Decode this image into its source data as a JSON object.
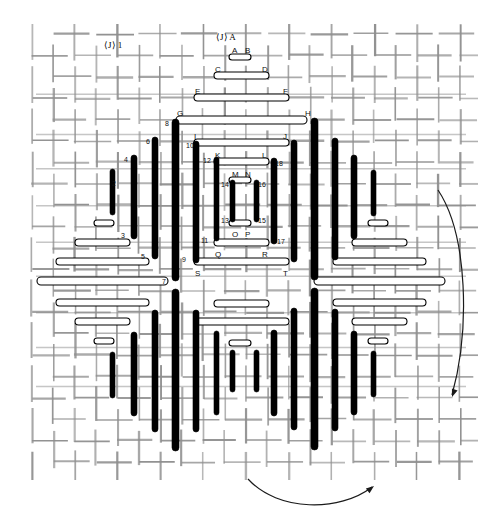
{
  "figure": {
    "type": "technical-line-drawing",
    "width": 502,
    "height": 529,
    "background_color": "#ffffff",
    "mesh_color": "#8f8f8f",
    "bar_fill_black": "#000000",
    "bar_fill_white": "#ffffff",
    "bar_stroke": "#000000"
  },
  "section_markers": [
    {
      "name": "section-j-left",
      "text": "⟨J⟩",
      "suffix": "1",
      "x": 104,
      "y": 41
    },
    {
      "name": "section-j-top",
      "text": "⟨J⟩",
      "suffix": "A",
      "x": 216,
      "y": 33
    }
  ],
  "letter_pairs": [
    {
      "name": "pair-ab",
      "left": "A",
      "right": "B",
      "lx": 232,
      "ly": 47,
      "rx": 245,
      "ry": 47,
      "bar": {
        "x": 229,
        "y": 54,
        "w": 22,
        "h": 6
      }
    },
    {
      "name": "pair-cd",
      "left": "C",
      "right": "D",
      "lx": 215,
      "ly": 66,
      "rx": 262,
      "ry": 66,
      "bar": {
        "x": 214,
        "y": 72,
        "w": 55,
        "h": 7
      }
    },
    {
      "name": "pair-ef",
      "left": "E",
      "right": "F",
      "lx": 195,
      "ly": 88,
      "rx": 283,
      "ry": 88,
      "bar": {
        "x": 194,
        "y": 94,
        "w": 95,
        "h": 7
      }
    },
    {
      "name": "pair-gh",
      "left": "G",
      "right": "H",
      "lx": 177,
      "ly": 110,
      "rx": 305,
      "ry": 110,
      "bar": {
        "x": 176,
        "y": 116,
        "w": 131,
        "h": 8
      }
    },
    {
      "name": "pair-ij",
      "left": "I",
      "right": "J",
      "lx": 194,
      "ly": 133,
      "rx": 283,
      "ry": 133,
      "bar": {
        "x": 194,
        "y": 139,
        "w": 95,
        "h": 7
      }
    },
    {
      "name": "pair-kl",
      "left": "K",
      "right": "L",
      "lx": 215,
      "ly": 152,
      "rx": 262,
      "ry": 152,
      "bar": {
        "x": 214,
        "y": 158,
        "w": 55,
        "h": 7
      }
    },
    {
      "name": "pair-mn",
      "left": "M",
      "right": "N",
      "lx": 232,
      "ly": 171,
      "rx": 245,
      "ry": 171,
      "bar": {
        "x": 229,
        "y": 177,
        "w": 22,
        "h": 6
      }
    },
    {
      "name": "pair-op",
      "left": "O",
      "right": "P",
      "lx": 232,
      "ly": 231,
      "rx": 245,
      "ry": 231,
      "bar": {
        "x": 229,
        "y": 220,
        "w": 22,
        "h": 6
      }
    },
    {
      "name": "pair-qr",
      "left": "Q",
      "right": "R",
      "lx": 215,
      "ly": 251,
      "rx": 262,
      "ry": 251,
      "bar": {
        "x": 214,
        "y": 239,
        "w": 55,
        "h": 7
      }
    },
    {
      "name": "pair-st",
      "left": "S",
      "right": "T",
      "lx": 195,
      "ly": 270,
      "rx": 283,
      "ry": 270,
      "bar": {
        "x": 194,
        "y": 258,
        "w": 95,
        "h": 7
      }
    }
  ],
  "even_labels": [
    {
      "text": "2",
      "x": 112,
      "y": 180
    },
    {
      "text": "4",
      "x": 124,
      "y": 156
    },
    {
      "text": "6",
      "x": 146,
      "y": 138
    },
    {
      "text": "8",
      "x": 165,
      "y": 120
    },
    {
      "text": "10",
      "x": 186,
      "y": 142
    },
    {
      "text": "12",
      "x": 203,
      "y": 157
    },
    {
      "text": "14",
      "x": 221,
      "y": 181
    },
    {
      "text": "16",
      "x": 258,
      "y": 181
    },
    {
      "text": "18",
      "x": 275,
      "y": 160
    }
  ],
  "odd_labels": [
    {
      "text": "3",
      "x": 121,
      "y": 232
    },
    {
      "text": "5",
      "x": 141,
      "y": 253
    },
    {
      "text": "7",
      "x": 162,
      "y": 278
    },
    {
      "text": "9",
      "x": 182,
      "y": 256
    },
    {
      "text": "11",
      "x": 201,
      "y": 237
    },
    {
      "text": "13",
      "x": 221,
      "y": 217
    },
    {
      "text": "15",
      "x": 258,
      "y": 217
    },
    {
      "text": "17",
      "x": 277,
      "y": 238
    }
  ],
  "black_bars_top": [
    {
      "x": 110,
      "y": 169,
      "h": 46,
      "w": 5
    },
    {
      "x": 131,
      "y": 155,
      "h": 84,
      "w": 6
    },
    {
      "x": 152,
      "y": 137,
      "h": 122,
      "w": 6
    },
    {
      "x": 172,
      "y": 119,
      "h": 162,
      "w": 7
    },
    {
      "x": 193,
      "y": 141,
      "h": 122,
      "w": 6
    },
    {
      "x": 214,
      "y": 157,
      "h": 84,
      "w": 5
    },
    {
      "x": 230,
      "y": 180,
      "h": 42,
      "w": 5
    },
    {
      "x": 254,
      "y": 180,
      "h": 42,
      "w": 5
    },
    {
      "x": 271,
      "y": 158,
      "h": 86,
      "w": 6
    },
    {
      "x": 291,
      "y": 140,
      "h": 122,
      "w": 6
    },
    {
      "x": 311,
      "y": 118,
      "h": 162,
      "w": 7
    },
    {
      "x": 332,
      "y": 138,
      "h": 122,
      "w": 6
    },
    {
      "x": 351,
      "y": 155,
      "h": 84,
      "w": 6
    },
    {
      "x": 371,
      "y": 170,
      "h": 46,
      "w": 5
    }
  ],
  "black_bars_bottom": [
    {
      "x": 110,
      "y": 352,
      "h": 46,
      "w": 5
    },
    {
      "x": 131,
      "y": 332,
      "h": 84,
      "w": 6
    },
    {
      "x": 152,
      "y": 310,
      "h": 122,
      "w": 6
    },
    {
      "x": 172,
      "y": 289,
      "h": 162,
      "w": 7
    },
    {
      "x": 193,
      "y": 310,
      "h": 122,
      "w": 6
    },
    {
      "x": 214,
      "y": 331,
      "h": 84,
      "w": 5
    },
    {
      "x": 230,
      "y": 350,
      "h": 42,
      "w": 5
    },
    {
      "x": 254,
      "y": 350,
      "h": 42,
      "w": 5
    },
    {
      "x": 271,
      "y": 330,
      "h": 86,
      "w": 6
    },
    {
      "x": 291,
      "y": 308,
      "h": 122,
      "w": 6
    },
    {
      "x": 311,
      "y": 288,
      "h": 162,
      "w": 7
    },
    {
      "x": 332,
      "y": 309,
      "h": 122,
      "w": 6
    },
    {
      "x": 351,
      "y": 331,
      "h": 84,
      "w": 6
    },
    {
      "x": 371,
      "y": 351,
      "h": 46,
      "w": 5
    }
  ],
  "white_bars_outer": [
    {
      "x": 94,
      "y": 220,
      "w": 20,
      "h": 6
    },
    {
      "x": 75,
      "y": 239,
      "w": 55,
      "h": 7
    },
    {
      "x": 56,
      "y": 258,
      "w": 93,
      "h": 7
    },
    {
      "x": 37,
      "y": 277,
      "w": 131,
      "h": 8
    },
    {
      "x": 56,
      "y": 299,
      "w": 93,
      "h": 7
    },
    {
      "x": 75,
      "y": 318,
      "w": 55,
      "h": 7
    },
    {
      "x": 94,
      "y": 338,
      "w": 20,
      "h": 6
    },
    {
      "x": 368,
      "y": 220,
      "w": 20,
      "h": 6
    },
    {
      "x": 352,
      "y": 239,
      "w": 55,
      "h": 7
    },
    {
      "x": 333,
      "y": 258,
      "w": 93,
      "h": 7
    },
    {
      "x": 314,
      "y": 277,
      "w": 131,
      "h": 8
    },
    {
      "x": 333,
      "y": 299,
      "w": 93,
      "h": 7
    },
    {
      "x": 352,
      "y": 318,
      "w": 55,
      "h": 7
    },
    {
      "x": 368,
      "y": 338,
      "w": 20,
      "h": 6
    },
    {
      "x": 214,
      "y": 300,
      "w": 55,
      "h": 7
    },
    {
      "x": 194,
      "y": 318,
      "w": 95,
      "h": 7
    },
    {
      "x": 229,
      "y": 340,
      "w": 22,
      "h": 6
    }
  ],
  "arrows": [
    {
      "name": "flow-arrow-right",
      "d": "M 438 190 C 468 235 470 330 452 395",
      "head_x": 452,
      "head_y": 397,
      "head_angle": 110
    },
    {
      "name": "flow-arrow-bottom",
      "d": "M 248 479 C 278 512 340 512 372 487",
      "head_x": 374,
      "head_y": 486,
      "head_angle": -38
    }
  ],
  "legend_note": ""
}
